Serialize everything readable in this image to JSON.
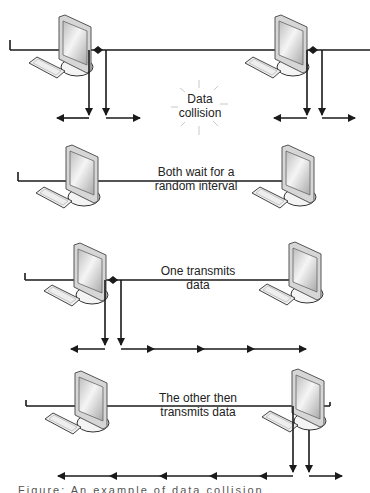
{
  "diagram": {
    "colors": {
      "line": "#1a1a1a",
      "monitor_frame": "#888888",
      "screen": "#dcdcdc",
      "burst": "#c8c8c8",
      "text": "#222222"
    },
    "panels": [
      {
        "id": "collision",
        "label_line1": "Data",
        "label_line2": "collision",
        "icon": "collision-burst-icon"
      },
      {
        "id": "wait",
        "label_line1": "Both wait for a",
        "label_line2": "random interval"
      },
      {
        "id": "one-transmits",
        "label_line1": "One transmits",
        "label_line2": "data"
      },
      {
        "id": "other-transmits",
        "label_line1": "The other then",
        "label_line2": "transmits data"
      }
    ],
    "caption": "Figure: An example of data collision"
  }
}
